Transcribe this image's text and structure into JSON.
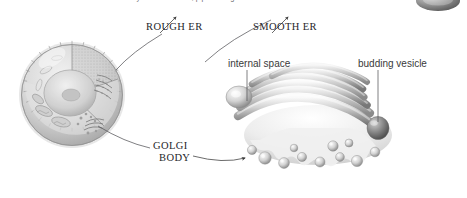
{
  "figure": {
    "type": "biology-diagram",
    "background_color": "#ffffff",
    "caption_top": "the diameters of many interconnected, pipeline regions of smooth ER"
  },
  "labels": {
    "rough_er": "ROUGH ER",
    "smooth_er": "SMOOTH ER",
    "golgi_body_line1": "GOLGI",
    "golgi_body_line2": "BODY",
    "internal_space": "internal space",
    "budding_vesicle": "budding vesicle"
  },
  "illustrations": {
    "cell": {
      "name": "cutaway-animal-cell",
      "parts": [
        "plasma membrane",
        "nucleus",
        "nucleolus",
        "mitochondria",
        "rough ER",
        "smooth ER",
        "golgi body",
        "vesicles"
      ]
    },
    "golgi": {
      "name": "golgi-body-detail",
      "cisternae_count": 6,
      "vesicle_count": 11
    },
    "corner_organelle": {
      "name": "clipped-vesicle-thumbnail"
    }
  },
  "colors": {
    "ink": "#26262a",
    "label_sans": "#3a3a3a",
    "caption": "#6e6e72",
    "leader_line": "#55555a",
    "art_light": "#e8e8e8",
    "art_mid": "#b9b9b9",
    "art_dark": "#6d6d6d"
  }
}
